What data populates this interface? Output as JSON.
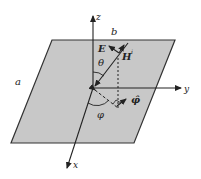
{
  "diagram": {
    "labels": {
      "region_a": "a",
      "region_b": "b",
      "axis_x": "x",
      "axis_y": "y",
      "axis_z": "z",
      "theta": "θ",
      "phi": "φ",
      "phi_hat": "φ̂",
      "e_field": "E",
      "h_field": "H",
      "h_superscript": "i"
    },
    "colors": {
      "plane_fill": "#c8c8c8",
      "stroke": "#222222",
      "background": "#ffffff"
    }
  }
}
